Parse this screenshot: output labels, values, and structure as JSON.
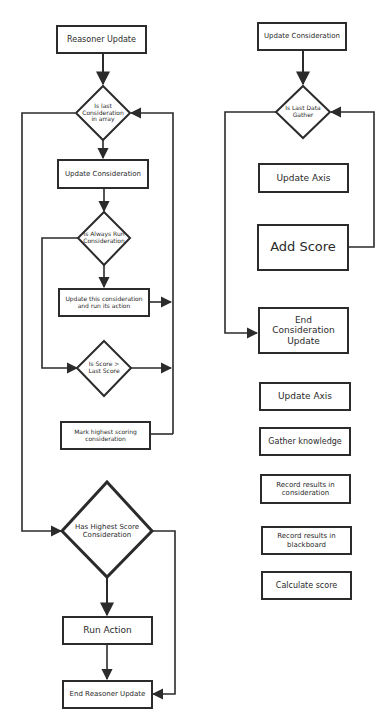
{
  "reasoner_flow": {
    "start": "Reasoner Update",
    "decision_last_consideration": "Is last Consideration in array",
    "update_consideration": "Update Consideration",
    "decision_always_run": "Is Always Run Consideration",
    "update_and_run": "Update this consideration and run its action",
    "decision_score_greater": "Is Score > Last Score",
    "mark_highest": "Mark highest scoring consideration",
    "decision_has_highest": "Has Highest Score Consideration",
    "run_action": "Run Action",
    "end": "End Reasoner Update"
  },
  "consideration_flow": {
    "start": "Update Consideration",
    "decision_last_data": "Is Last Data Gather",
    "update_axis": "Update Axis",
    "add_score": "Add Score",
    "end": "End Consideration Update"
  },
  "axis_steps": {
    "items": [
      "Update Axis",
      "Gather knowledge",
      "Record results in consideration",
      "Record results in blackboard",
      "Calculate score"
    ]
  },
  "colors": {
    "stroke": "#2b2b2b",
    "background": "#ffffff"
  }
}
